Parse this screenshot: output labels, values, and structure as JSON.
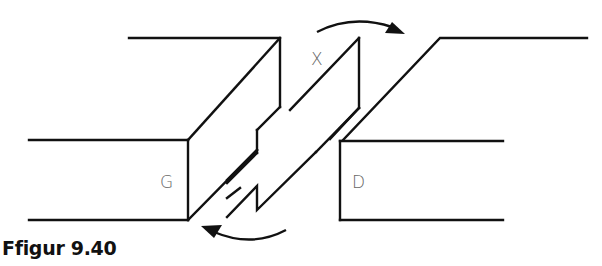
{
  "figure": {
    "caption": "Ffigur 9.40",
    "labels": {
      "left_block": "G",
      "right_block": "D",
      "center_gap": "X"
    },
    "colors": {
      "line": "#111111",
      "label": "#666666"
    }
  }
}
